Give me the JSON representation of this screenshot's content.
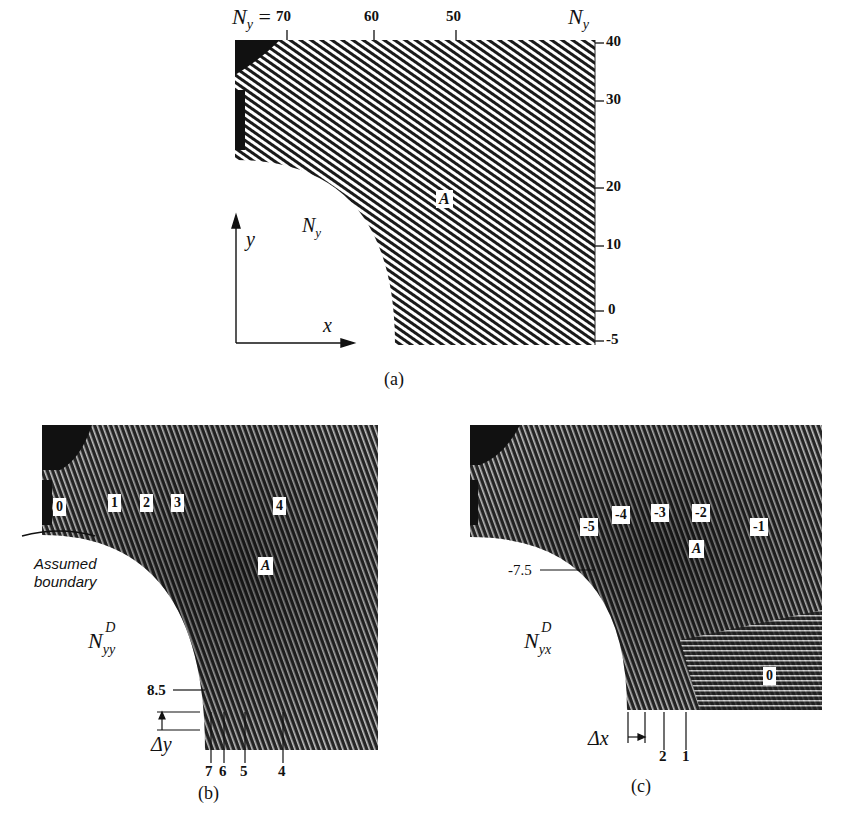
{
  "panel_a": {
    "caption": "(a)",
    "top_label_prefix": "N",
    "top_label_sub": "y",
    "top_label_eq": "=",
    "top_ticks": [
      "70",
      "60",
      "50"
    ],
    "right_axis_label": "N",
    "right_axis_sub": "y",
    "right_ticks": [
      "40",
      "30",
      "20",
      "10",
      "0",
      "-5"
    ],
    "field_label": "N",
    "field_label_sub": "y",
    "point_label": "A",
    "axis_x_label": "x",
    "axis_y_label": "y"
  },
  "panel_b": {
    "caption": "(b)",
    "fringe_labels": [
      "0",
      "1",
      "2",
      "3",
      "4"
    ],
    "point_label": "A",
    "annotation_line1": "Assumed",
    "annotation_line2": "boundary",
    "field_label": "N",
    "field_label_sup": "D",
    "field_label_sub": "yy",
    "boundary_value": "8.5",
    "delta_label": "Δy",
    "bottom_ticks": [
      "7",
      "6",
      "5",
      "4"
    ]
  },
  "panel_c": {
    "caption": "(c)",
    "fringe_labels": [
      "-5",
      "-4",
      "-3",
      "-2",
      "-1",
      "0"
    ],
    "point_label": "A",
    "field_label": "N",
    "field_label_sup": "D",
    "field_label_sub": "yx",
    "boundary_value": "-7.5",
    "delta_label": "Δx",
    "bottom_ticks": [
      "2",
      "1"
    ]
  }
}
